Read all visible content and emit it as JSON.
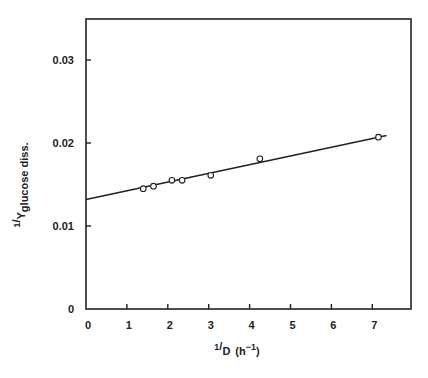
{
  "chart_data": {
    "type": "scatter",
    "title": "",
    "xlabel": "1/D (h-1)",
    "ylabel": "1/Y glucose diss.",
    "xlabel_parts": {
      "num": "1",
      "den": "D",
      "unit": "(h",
      "exp": "−1",
      "close": ")"
    },
    "ylabel_parts": {
      "num": "1",
      "den": "Y",
      "sub": "glucose diss."
    },
    "xlim": [
      0,
      7.8
    ],
    "ylim": [
      0,
      0.035
    ],
    "x_ticks": [
      0,
      1,
      2,
      3,
      4,
      5,
      6,
      7
    ],
    "x_tick_labels": [
      "0",
      "1",
      "2",
      "3",
      "4",
      "5",
      "6",
      "7"
    ],
    "y_ticks": [
      0,
      0.01,
      0.02,
      0.03
    ],
    "y_tick_labels": [
      "0",
      "0.01",
      "0.02",
      "0.03"
    ],
    "grid": false,
    "legend": null,
    "series": [
      {
        "name": "data points",
        "marker": "open-circle",
        "x": [
          1.4,
          1.65,
          2.1,
          2.35,
          3.05,
          4.25,
          7.15
        ],
        "y": [
          0.0145,
          0.0148,
          0.0155,
          0.0155,
          0.0161,
          0.0181,
          0.0207
        ]
      },
      {
        "name": "linear fit",
        "type": "line",
        "x": [
          0,
          7.35
        ],
        "y": [
          0.0132,
          0.0209
        ]
      }
    ]
  },
  "colors": {
    "ink": "#222222",
    "background": "#ffffff"
  }
}
